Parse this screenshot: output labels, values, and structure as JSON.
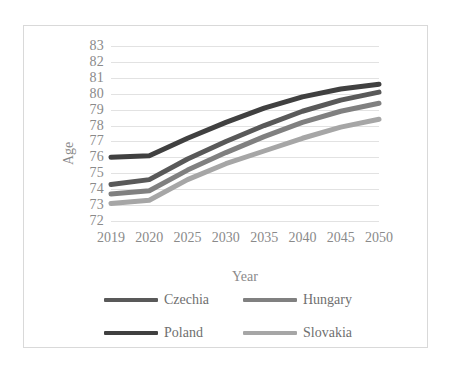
{
  "chart_data": {
    "type": "line",
    "title": "",
    "xlabel": "Year",
    "ylabel": "Age",
    "categories": [
      "2019",
      "2020",
      "2025",
      "2030",
      "2035",
      "2040",
      "2045",
      "2050"
    ],
    "ylim": [
      72,
      83
    ],
    "yticks": [
      "72",
      "73",
      "74",
      "75",
      "76",
      "77",
      "78",
      "79",
      "80",
      "81",
      "82",
      "83"
    ],
    "grid": true,
    "legend_position": "bottom",
    "series": [
      {
        "name": "Czechia",
        "color": "#595959",
        "values": [
          74.3,
          74.6,
          75.9,
          77.0,
          78.0,
          78.9,
          79.6,
          80.1
        ]
      },
      {
        "name": "Hungary",
        "color": "#808080",
        "values": [
          73.7,
          73.9,
          75.2,
          76.3,
          77.3,
          78.2,
          78.9,
          79.4
        ]
      },
      {
        "name": "Poland",
        "color": "#404040",
        "values": [
          76.0,
          76.1,
          77.2,
          78.2,
          79.1,
          79.8,
          80.3,
          80.6
        ]
      },
      {
        "name": "Slovakia",
        "color": "#a6a6a6",
        "values": [
          73.1,
          73.3,
          74.6,
          75.6,
          76.4,
          77.2,
          77.9,
          78.4
        ]
      }
    ]
  },
  "legend": {
    "items": [
      {
        "label": "Czechia",
        "color": "#595959"
      },
      {
        "label": "Hungary",
        "color": "#808080"
      },
      {
        "label": "Poland",
        "color": "#404040"
      },
      {
        "label": "Slovakia",
        "color": "#a6a6a6"
      }
    ]
  },
  "axes": {
    "y_title": "Age",
    "x_title": "Year"
  }
}
